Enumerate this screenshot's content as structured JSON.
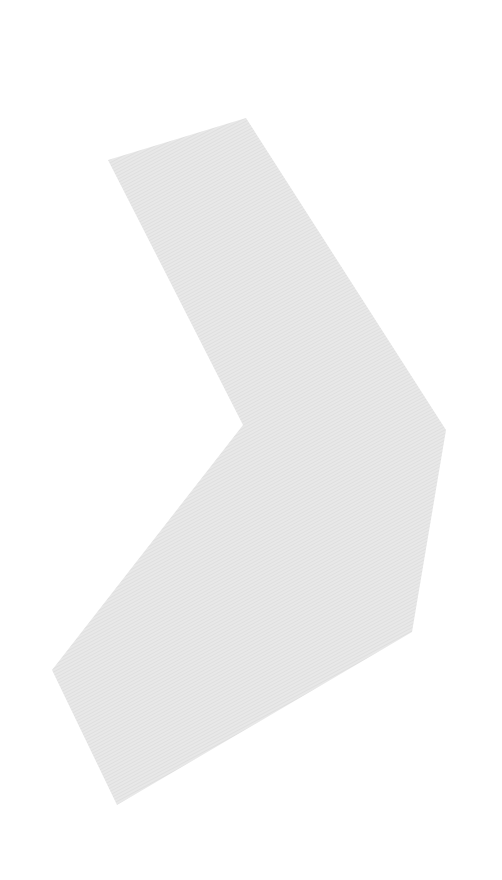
{
  "image": {
    "width": 502,
    "height": 880,
    "background": "#ffffff"
  },
  "shape": {
    "name": "chevron-shape",
    "fill": "#e6e6e6",
    "texture_line": "#d8d8d8",
    "points": "108,160 246,118 446,430 412,632 117,805 52,670 243,425"
  }
}
